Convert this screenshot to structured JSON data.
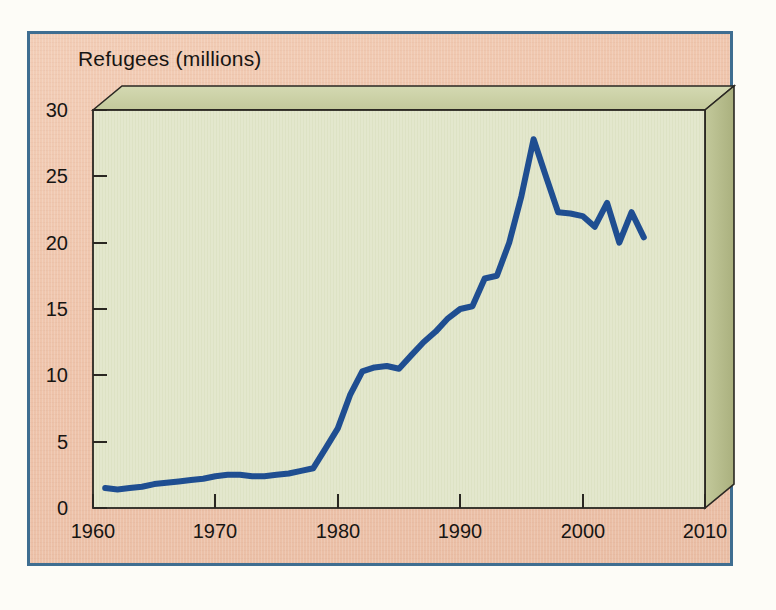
{
  "figure": {
    "title": "Refugees (millions)",
    "frame_border_color": "#3f6e91",
    "panel_background_color": "#eec4ab",
    "plot_face_color": "#e2e6cc",
    "plot_side_color": "#b6bd8c",
    "plot_top_color": "#ccd2a8",
    "line_color": "#1f4e91",
    "axis_color": "#2a2722",
    "page_background_color": "#fdfcf7"
  },
  "chart_data": {
    "type": "line",
    "title": "Refugees (millions)",
    "xlabel": "",
    "ylabel": "Refugees (millions)",
    "xlim": [
      1960,
      2010
    ],
    "ylim": [
      0,
      30
    ],
    "xticks": [
      1960,
      1970,
      1980,
      1990,
      2000,
      2010
    ],
    "yticks": [
      0,
      5,
      10,
      15,
      20,
      25,
      30
    ],
    "grid": false,
    "legend": null,
    "series": [
      {
        "name": "Refugees",
        "color": "#1f4e91",
        "x": [
          1961,
          1962,
          1963,
          1964,
          1965,
          1966,
          1967,
          1968,
          1969,
          1970,
          1971,
          1972,
          1973,
          1974,
          1975,
          1976,
          1977,
          1978,
          1979,
          1980,
          1981,
          1982,
          1983,
          1984,
          1985,
          1986,
          1987,
          1988,
          1989,
          1990,
          1991,
          1992,
          1993,
          1994,
          1995,
          1996,
          1997,
          1998,
          1999,
          2000,
          2001,
          2002,
          2003,
          2004,
          2005
        ],
        "values": [
          1.5,
          1.4,
          1.5,
          1.6,
          1.8,
          1.9,
          2.0,
          2.1,
          2.2,
          2.4,
          2.5,
          2.5,
          2.4,
          2.4,
          2.5,
          2.6,
          2.8,
          3.0,
          4.5,
          6.0,
          8.5,
          10.3,
          10.6,
          10.7,
          10.5,
          11.5,
          12.5,
          13.3,
          14.3,
          15.0,
          15.2,
          17.3,
          17.5,
          20.0,
          23.5,
          27.8,
          25.0,
          22.3,
          22.2,
          22.0,
          21.2,
          23.0,
          20.0,
          22.3,
          20.4
        ]
      }
    ],
    "annotations": [
      {
        "text": "rapid rise through the 1980s",
        "visible": false
      }
    ]
  },
  "axes": {
    "y_tick_labels": [
      "30",
      "25",
      "20",
      "15",
      "10",
      "5",
      "0"
    ],
    "x_tick_labels": [
      "1960",
      "1970",
      "1980",
      "1990",
      "2000",
      "2010"
    ]
  }
}
